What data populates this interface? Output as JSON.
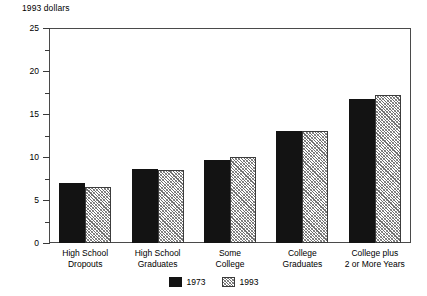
{
  "chart_data": {
    "type": "bar",
    "title": "",
    "ylabel": "1993 dollars",
    "xlabel": "",
    "ylim": [
      0,
      25
    ],
    "yticks": [
      0,
      5,
      10,
      15,
      20,
      25
    ],
    "ytick_labels": [
      "0",
      "5",
      "10",
      "15",
      "20",
      "25"
    ],
    "yminor_ticks": [
      2.5,
      7.5,
      12.5,
      17.5,
      22.5
    ],
    "grid": false,
    "legend_position": "bottom-center",
    "categories": [
      "High School\nDropouts",
      "High School\nGraduates",
      "Some\nCollege",
      "College\nGraduates",
      "College plus\n2 or More Years"
    ],
    "series": [
      {
        "name": "1973",
        "fill": "solid-black",
        "color": "#131313",
        "values": [
          7.0,
          8.6,
          9.6,
          13.0,
          16.8
        ]
      },
      {
        "name": "1993",
        "fill": "diagonal-hatch",
        "color": "#8a8a8a",
        "values": [
          6.5,
          8.5,
          10.0,
          13.0,
          17.2
        ]
      }
    ]
  },
  "legend": {
    "items": [
      {
        "label": "1973",
        "fill": "solid"
      },
      {
        "label": "1993",
        "fill": "hatch"
      }
    ]
  }
}
